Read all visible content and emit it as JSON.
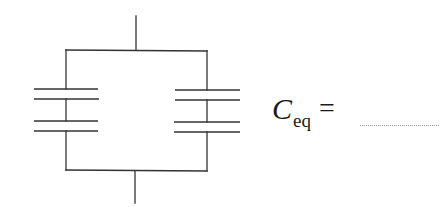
{
  "diagram": {
    "type": "circuit",
    "colors": {
      "line": "#333333",
      "text": "#1a1a1a",
      "blank": "#9a9a9a"
    },
    "components": [
      {
        "id": "left-branch",
        "capacitors": 2
      },
      {
        "id": "right-branch",
        "capacitors": 2
      }
    ]
  },
  "equation": {
    "symbol": "C",
    "subscript": "eq",
    "operator": "=",
    "answer": ""
  }
}
